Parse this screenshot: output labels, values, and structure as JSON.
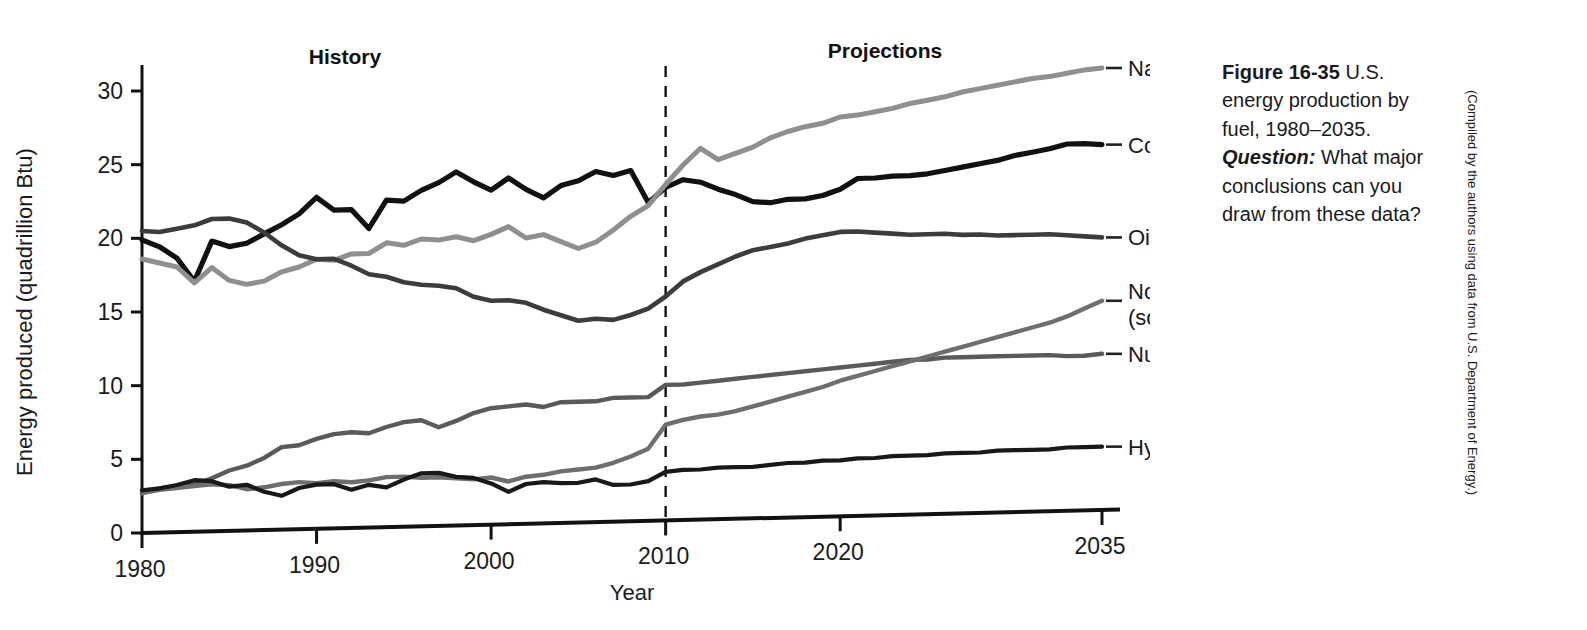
{
  "figure": {
    "caption_figure_number": "Figure 16-35",
    "caption_text_1": " U.S. energy production by fuel, 1980–2035. ",
    "caption_question_lead": "Question:",
    "caption_text_2": " What major conclusions can you draw from these data?",
    "credit": "(Compiled by the authors using data from U.S. Department of Energy.)"
  },
  "annotations": {
    "history_label": "History",
    "projections_label": "Projections",
    "divider_year": 2010
  },
  "series_labels": {
    "natural_gas": "Natural gas",
    "coal": "Coal",
    "oil": "Oil",
    "nonhydro_line1": "Nonhydro renewables",
    "nonhydro_line2": "(solar, wind, biomass, geothermal)",
    "nuclear": "Nuclear",
    "hydropower": "Hydropower"
  },
  "colors": {
    "coal": "#111111",
    "natural_gas": "#8f8f8f",
    "oil": "#3c3c3c",
    "nuclear": "#5a5a5a",
    "nonhydro": "#6e6e6e",
    "hydropower": "#181818",
    "axis": "#111111",
    "divider": "#111111"
  },
  "chart_data": {
    "type": "line",
    "title": "U.S. energy production by fuel, 1980–2035",
    "xlabel": "Year",
    "ylabel": "Energy produced (quadrillion Btu)",
    "xlim": [
      1980,
      2035
    ],
    "ylim": [
      0,
      31
    ],
    "xticks": [
      1980,
      1990,
      2000,
      2010,
      2020,
      2035
    ],
    "xticklabels": [
      "1980",
      "1990",
      "2000",
      "2010",
      "2020",
      "2035"
    ],
    "yticks": [
      0,
      5,
      10,
      15,
      20,
      25,
      30
    ],
    "yticklabels": [
      "0",
      "5",
      "10",
      "15",
      "20",
      "25",
      "30"
    ],
    "grid": false,
    "legend": "right-of-axes inline labels",
    "x": [
      1980,
      1981,
      1982,
      1983,
      1984,
      1985,
      1986,
      1987,
      1988,
      1989,
      1990,
      1991,
      1992,
      1993,
      1994,
      1995,
      1996,
      1997,
      1998,
      1999,
      2000,
      2001,
      2002,
      2003,
      2004,
      2005,
      2006,
      2007,
      2008,
      2009,
      2010,
      2011,
      2012,
      2013,
      2014,
      2015,
      2016,
      2017,
      2018,
      2019,
      2020,
      2021,
      2022,
      2023,
      2024,
      2025,
      2026,
      2027,
      2028,
      2029,
      2030,
      2031,
      2032,
      2033,
      2034,
      2035
    ],
    "series": [
      {
        "name": "Coal",
        "color": "#111111",
        "values": [
          19.9,
          19.4,
          18.6,
          17.0,
          19.7,
          19.3,
          19.5,
          20.1,
          20.7,
          21.4,
          22.5,
          21.6,
          21.6,
          20.3,
          22.2,
          22.1,
          22.8,
          23.3,
          24.0,
          23.3,
          22.7,
          23.5,
          22.7,
          22.1,
          22.9,
          23.2,
          23.8,
          23.5,
          23.8,
          21.6,
          22.6,
          23.1,
          22.9,
          22.4,
          22.0,
          21.5,
          21.4,
          21.6,
          21.6,
          21.8,
          22.2,
          22.9,
          22.9,
          23.0,
          23.0,
          23.1,
          23.3,
          23.5,
          23.7,
          23.9,
          24.2,
          24.4,
          24.6,
          24.9,
          24.9,
          24.8
        ]
      },
      {
        "name": "Natural gas",
        "color": "#8f8f8f",
        "values": [
          18.6,
          18.3,
          18.0,
          16.9,
          17.9,
          17.0,
          16.7,
          16.9,
          17.5,
          17.8,
          18.3,
          18.2,
          18.6,
          18.6,
          19.3,
          19.1,
          19.5,
          19.4,
          19.6,
          19.3,
          19.7,
          20.2,
          19.4,
          19.6,
          19.1,
          18.6,
          19.0,
          19.8,
          20.7,
          21.4,
          22.8,
          24.1,
          25.2,
          24.4,
          24.8,
          25.2,
          25.8,
          26.2,
          26.5,
          26.7,
          27.1,
          27.2,
          27.4,
          27.6,
          27.9,
          28.1,
          28.3,
          28.6,
          28.8,
          29.0,
          29.2,
          29.4,
          29.5,
          29.7,
          29.9,
          30.0
        ]
      },
      {
        "name": "Oil",
        "color": "#3c3c3c",
        "values": [
          20.5,
          20.4,
          20.6,
          20.8,
          21.2,
          21.2,
          20.9,
          20.2,
          19.3,
          18.6,
          18.3,
          18.3,
          17.8,
          17.2,
          17.0,
          16.6,
          16.4,
          16.3,
          16.1,
          15.5,
          15.2,
          15.2,
          15.0,
          14.5,
          14.1,
          13.7,
          13.8,
          13.7,
          14.0,
          14.4,
          15.2,
          16.2,
          16.8,
          17.3,
          17.8,
          18.2,
          18.4,
          18.6,
          18.9,
          19.1,
          19.3,
          19.3,
          19.2,
          19.1,
          19.0,
          19.0,
          19.0,
          18.9,
          18.9,
          18.8,
          18.8,
          18.8,
          18.8,
          18.7,
          18.6,
          18.5
        ]
      },
      {
        "name": "Nuclear",
        "color": "#5a5a5a",
        "values": [
          2.7,
          3.0,
          3.1,
          3.2,
          3.6,
          4.1,
          4.4,
          4.9,
          5.6,
          5.7,
          6.1,
          6.4,
          6.5,
          6.4,
          6.8,
          7.1,
          7.2,
          6.7,
          7.1,
          7.6,
          7.9,
          8.0,
          8.1,
          7.9,
          8.2,
          8.2,
          8.2,
          8.4,
          8.4,
          8.4,
          9.2,
          9.2,
          9.3,
          9.4,
          9.5,
          9.6,
          9.7,
          9.8,
          9.9,
          10.0,
          10.1,
          10.2,
          10.3,
          10.4,
          10.5,
          10.5,
          10.6,
          10.6,
          10.6,
          10.6,
          10.6,
          10.6,
          10.6,
          10.5,
          10.5,
          10.6
        ]
      },
      {
        "name": "Nonhydro renewables",
        "color": "#6e6e6e",
        "values": [
          2.7,
          2.9,
          3.0,
          3.1,
          3.2,
          3.1,
          2.8,
          2.9,
          3.1,
          3.2,
          3.1,
          3.2,
          3.1,
          3.2,
          3.4,
          3.4,
          3.3,
          3.3,
          3.2,
          3.1,
          3.2,
          2.9,
          3.2,
          3.3,
          3.5,
          3.6,
          3.7,
          4.0,
          4.4,
          4.9,
          6.5,
          6.8,
          7.0,
          7.1,
          7.3,
          7.6,
          7.9,
          8.2,
          8.5,
          8.8,
          9.2,
          9.5,
          9.8,
          10.1,
          10.4,
          10.7,
          11.0,
          11.3,
          11.6,
          11.9,
          12.2,
          12.5,
          12.8,
          13.2,
          13.7,
          14.2
        ]
      },
      {
        "name": "Hydropower",
        "color": "#181818",
        "values": [
          2.9,
          3.0,
          3.2,
          3.5,
          3.4,
          3.0,
          3.1,
          2.6,
          2.3,
          2.8,
          3.0,
          3.0,
          2.6,
          2.9,
          2.7,
          3.2,
          3.6,
          3.6,
          3.3,
          3.2,
          2.8,
          2.2,
          2.7,
          2.8,
          2.7,
          2.7,
          2.9,
          2.5,
          2.5,
          2.7,
          3.3,
          3.4,
          3.4,
          3.5,
          3.5,
          3.5,
          3.6,
          3.7,
          3.7,
          3.8,
          3.8,
          3.9,
          3.9,
          4.0,
          4.0,
          4.0,
          4.1,
          4.1,
          4.1,
          4.2,
          4.2,
          4.2,
          4.2,
          4.3,
          4.3,
          4.3
        ]
      }
    ]
  }
}
